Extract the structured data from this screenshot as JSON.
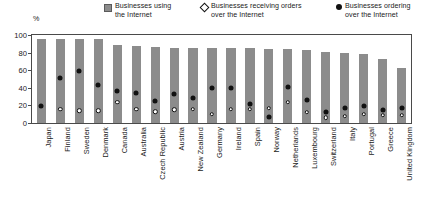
{
  "axis": {
    "y_unit_label": "%",
    "y_ticks": [
      0,
      20,
      40,
      60,
      80,
      100
    ]
  },
  "legend": {
    "items": [
      {
        "marker": "gray-square",
        "label": "Businesses using\nthe Internet"
      },
      {
        "marker": "white-diamond",
        "label": "Businesses receiving orders\nover the Internet"
      },
      {
        "marker": "black-circle",
        "label": "Businesses ordering\nover the Internet"
      }
    ]
  },
  "colors": {
    "bar": "#8c8c8c",
    "marker_black": "#111111",
    "marker_white": "#ffffff",
    "axis": "#4a4a4a"
  },
  "chart_data": {
    "type": "bar",
    "title": "",
    "subtitle": "",
    "xlabel": "",
    "ylabel": "%",
    "ylim": [
      0,
      100
    ],
    "grid": false,
    "legend_position": "top",
    "categories": [
      "Japan",
      "Finland",
      "Sweden",
      "Denmark",
      "Canada",
      "Australia",
      "Czech Republic",
      "Austria",
      "New Zealand",
      "Germany",
      "Ireland",
      "Spain",
      "Norway",
      "Netherlands",
      "Luxembourg",
      "Switzerland",
      "Italy",
      "Portugal",
      "Greece",
      "United Kingdom"
    ],
    "series": [
      {
        "name": "Businesses using the Internet",
        "marker": "gray-square",
        "values": [
          96,
          96,
          95,
          95,
          89,
          88,
          86,
          85,
          85,
          85,
          85,
          85,
          84,
          84,
          83,
          81,
          80,
          78,
          73,
          63
        ]
      },
      {
        "name": "Businesses receiving orders over the Internet",
        "marker": "white-diamond",
        "values": [
          null,
          16,
          14,
          14,
          24,
          16,
          13,
          15,
          16,
          10,
          16,
          16,
          17,
          24,
          12,
          6,
          8,
          10,
          9,
          9
        ]
      },
      {
        "name": "Businesses ordering over the Internet",
        "marker": "black-circle",
        "values": [
          19,
          51,
          59,
          43,
          36,
          34,
          25,
          33,
          28,
          40,
          40,
          22,
          7,
          41,
          26,
          13,
          17,
          19,
          15,
          17
        ]
      }
    ]
  }
}
